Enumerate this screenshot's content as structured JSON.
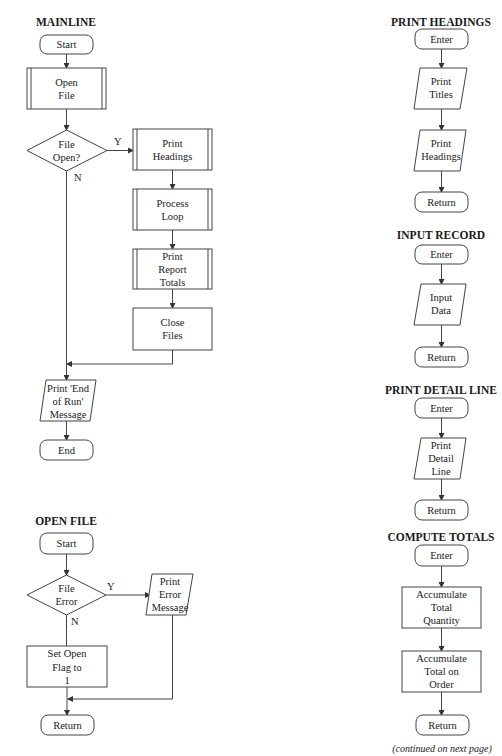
{
  "charts": {
    "mainline": {
      "title": "MAINLINE",
      "start": "Start",
      "open_file": [
        "Open",
        "File"
      ],
      "decision": [
        "File",
        "Open?"
      ],
      "yes_label": "Y",
      "no_label": "N",
      "print_headings": [
        "Print",
        "Headings"
      ],
      "process_loop": [
        "Process",
        "Loop"
      ],
      "print_report_totals": [
        "Print",
        "Report",
        "Totals"
      ],
      "close_files": [
        "Close",
        "Files"
      ],
      "print_end_of_run": [
        "Print 'End",
        "of Run'",
        "Message"
      ],
      "end": "End"
    },
    "open_file": {
      "title": "OPEN FILE",
      "start": "Start",
      "decision": [
        "File",
        "Error"
      ],
      "yes_label": "Y",
      "no_label": "N",
      "print_error": [
        "Print",
        "Error",
        "Message"
      ],
      "set_flag": [
        "Set Open",
        "Flag to",
        "1"
      ],
      "return": "Return"
    },
    "print_headings": {
      "title": "PRINT HEADINGS",
      "enter": "Enter",
      "print_titles": [
        "Print",
        "Titles"
      ],
      "print_headings": [
        "Print",
        "Headings"
      ],
      "return": "Return"
    },
    "input_record": {
      "title": "INPUT RECORD",
      "enter": "Enter",
      "input_data": [
        "Input",
        "Data"
      ],
      "return": "Return"
    },
    "print_detail_line": {
      "title": "PRINT DETAIL LINE",
      "enter": "Enter",
      "print_detail": [
        "Print",
        "Detail",
        "Line"
      ],
      "return": "Return"
    },
    "compute_totals": {
      "title": "COMPUTE TOTALS",
      "enter": "Enter",
      "accum_quantity": [
        "Accumulate",
        "Total",
        "Quantity"
      ],
      "accum_on_order": [
        "Accumulate",
        "Total on",
        "Order"
      ],
      "return": "Return"
    }
  },
  "footer": {
    "continued": "(continued on next page)"
  },
  "colors": {
    "line": "#444444",
    "text": "#1a1a1a",
    "background": "#ffffff"
  }
}
